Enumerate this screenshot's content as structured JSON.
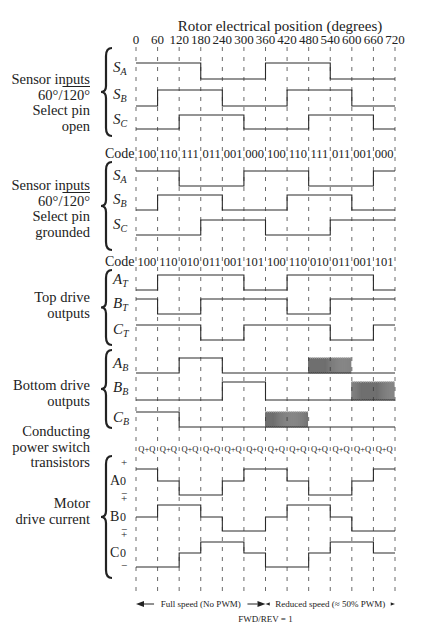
{
  "title": "Rotor electrical position (degrees)",
  "chart_data": {
    "type": "timing-diagram",
    "title": "Rotor electrical position (degrees)",
    "xlabel": "Rotor electrical position (degrees)",
    "x_ticks": [
      0,
      60,
      120,
      180,
      240,
      300,
      360,
      420,
      480,
      540,
      600,
      660,
      720
    ],
    "xlim": [
      0,
      720
    ],
    "grid": "vertical dashed every 60 degrees",
    "groups": [
      {
        "id": "sensor-open",
        "label": [
          "Sensor inputs",
          "60°/120° (overline)",
          "Select pin",
          "open"
        ],
        "signals": [
          {
            "name": "S_A",
            "levels": [
              1,
              1,
              1,
              0,
              0,
              0,
              1,
              1,
              1,
              0,
              0,
              0
            ]
          },
          {
            "name": "S_B",
            "levels": [
              0,
              1,
              1,
              1,
              0,
              0,
              0,
              1,
              1,
              1,
              0,
              0
            ]
          },
          {
            "name": "S_C",
            "levels": [
              0,
              0,
              1,
              1,
              1,
              0,
              0,
              0,
              1,
              1,
              1,
              0
            ]
          }
        ]
      },
      {
        "id": "sensor-grounded",
        "label": [
          "Sensor inputs",
          "60°/120° (overline)",
          "Select pin",
          "grounded"
        ],
        "codes": [
          "100",
          "110",
          "111",
          "011",
          "001",
          "000",
          "100",
          "110",
          "111",
          "011",
          "001",
          "000"
        ],
        "signals": [
          {
            "name": "S_A",
            "levels": [
              1,
              1,
              0,
              0,
              0,
              1,
              1,
              1,
              0,
              0,
              0,
              1
            ]
          },
          {
            "name": "S_B",
            "levels": [
              0,
              1,
              1,
              1,
              0,
              0,
              0,
              1,
              1,
              1,
              0,
              0
            ]
          },
          {
            "name": "S_C",
            "levels": [
              0,
              0,
              0,
              1,
              1,
              1,
              0,
              0,
              0,
              1,
              1,
              1
            ]
          }
        ]
      },
      {
        "id": "top-drive",
        "label": [
          "Top drive",
          "outputs"
        ],
        "codes": [
          "100",
          "110",
          "010",
          "011",
          "001",
          "101",
          "100",
          "110",
          "010",
          "011",
          "001",
          "101"
        ],
        "signals": [
          {
            "name": "A_T",
            "levels": [
              0,
              1,
              1,
              1,
              1,
              0,
              0,
              1,
              1,
              1,
              1,
              0
            ]
          },
          {
            "name": "B_T",
            "levels": [
              1,
              0,
              0,
              1,
              1,
              1,
              1,
              0,
              0,
              1,
              1,
              1
            ]
          },
          {
            "name": "C_T",
            "levels": [
              1,
              1,
              1,
              0,
              0,
              1,
              1,
              1,
              1,
              0,
              0,
              1
            ]
          }
        ]
      },
      {
        "id": "bottom-drive",
        "label": [
          "Bottom drive",
          "outputs"
        ],
        "signals": [
          {
            "name": "A_B",
            "levels": [
              0,
              0,
              1,
              1,
              0,
              0,
              0,
              0,
              "P",
              "P",
              0,
              0
            ]
          },
          {
            "name": "B_B",
            "levels": [
              0,
              0,
              0,
              0,
              1,
              1,
              0,
              0,
              0,
              0,
              "P",
              "P"
            ]
          },
          {
            "name": "C_B",
            "levels": [
              1,
              1,
              0,
              0,
              0,
              0,
              "P",
              "P",
              0,
              0,
              0,
              0
            ]
          }
        ],
        "pwm_note": "P = PWM chopped (≈50% duty) during reduced speed"
      },
      {
        "id": "conducting",
        "label": [
          "Conducting",
          "power switch",
          "transistors"
        ],
        "segments": [
          "Q+Q",
          "Q+Q",
          "Q+Q",
          "Q+Q",
          "Q+Q",
          "Q+Q",
          "Q+Q",
          "Q+Q",
          "Q+Q",
          "Q+Q",
          "Q+Q",
          "Q+Q"
        ]
      },
      {
        "id": "motor-current",
        "label": [
          "Motor",
          "drive current"
        ],
        "signals": [
          {
            "name": "A",
            "levels": [
              1,
              0,
              -1,
              -1,
              0,
              1,
              1,
              0,
              -1,
              -1,
              0,
              1
            ]
          },
          {
            "name": "B",
            "levels": [
              0,
              1,
              1,
              0,
              -1,
              -1,
              0,
              1,
              1,
              0,
              -1,
              -1
            ]
          },
          {
            "name": "C",
            "levels": [
              -1,
              -1,
              0,
              1,
              1,
              0,
              -1,
              -1,
              0,
              1,
              1,
              0
            ]
          }
        ],
        "axis_marks": [
          "+",
          "0",
          "−"
        ]
      }
    ],
    "annotations": [
      {
        "text": "Full speed (No PWM)",
        "range": [
          0,
          360
        ]
      },
      {
        "text": "Reduced speed (≈ 50% PWM)",
        "range": [
          360,
          720
        ]
      },
      {
        "text": "FWD/REV = 1",
        "at": 360
      }
    ]
  },
  "labels": {
    "g1": [
      "Sensor inputs",
      "60°/",
      "120°",
      "Select pin",
      "open"
    ],
    "g2": [
      "Sensor inputs",
      "60°/",
      "120°",
      "Select pin",
      "grounded"
    ],
    "g3": [
      "Top drive",
      "outputs"
    ],
    "g4": [
      "Bottom drive",
      "outputs"
    ],
    "g5": [
      "Conducting",
      "power switch",
      "transistors"
    ],
    "g6": [
      "Motor",
      "drive current"
    ]
  },
  "code_label": "Code",
  "footer": {
    "full": "Full speed (No PWM)",
    "reduced": "Reduced speed (≈ 50% PWM)",
    "fwd": "FWD/REV = 1"
  }
}
